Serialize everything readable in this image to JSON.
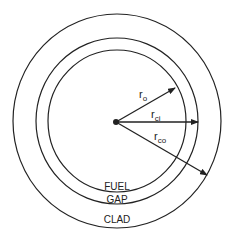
{
  "diagram": {
    "center": {
      "x": 117,
      "y": 121
    },
    "circles": [
      {
        "name": "fuel-outer-boundary",
        "rx": 69,
        "ry": 71
      },
      {
        "name": "clad-inner-boundary",
        "rx": 81,
        "ry": 83
      },
      {
        "name": "clad-outer-boundary",
        "rx": 104,
        "ry": 107
      }
    ],
    "radii": [
      {
        "label": "r",
        "sub": "o",
        "meaning": "fuel outer radius"
      },
      {
        "label": "r",
        "sub": "ci",
        "meaning": "clad inner radius"
      },
      {
        "label": "r",
        "sub": "co",
        "meaning": "clad outer radius"
      }
    ],
    "regions": {
      "fuel": "FUEL",
      "gap": "GAP",
      "clad": "CLAD"
    },
    "stroke_color": "#222222"
  }
}
